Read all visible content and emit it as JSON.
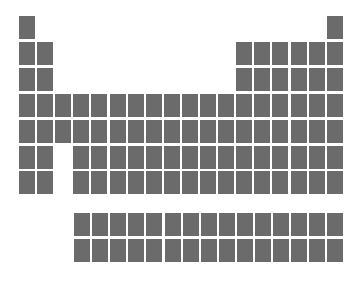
{
  "figure": {
    "name": "blank-periodic-table-grid",
    "width": 364,
    "height": 285,
    "background_color": "#ffffff",
    "cell_color": "#6b6b6b",
    "gap_color": "#ffffff"
  },
  "chart_data": {
    "type": "heatmap",
    "title": "",
    "subtitle": "",
    "xlabel": "",
    "ylabel": "",
    "grid": false,
    "legend": null,
    "annotations": [],
    "cell_value": null,
    "categories": [],
    "values": [],
    "geometry": {
      "main_origin_x": 19,
      "main_origin_y": 16,
      "f_origin_x": 74,
      "f_origin_y": 213,
      "cell_width": 16,
      "cell_height": 23,
      "pitch_x": 18.1,
      "pitch_y": 25.9
    },
    "main_block": {
      "columns": 18,
      "rows": 7,
      "occupancy": [
        [
          1,
          0,
          0,
          0,
          0,
          0,
          0,
          0,
          0,
          0,
          0,
          0,
          0,
          0,
          0,
          0,
          0,
          1
        ],
        [
          1,
          1,
          0,
          0,
          0,
          0,
          0,
          0,
          0,
          0,
          0,
          0,
          1,
          1,
          1,
          1,
          1,
          1
        ],
        [
          1,
          1,
          0,
          0,
          0,
          0,
          0,
          0,
          0,
          0,
          0,
          0,
          1,
          1,
          1,
          1,
          1,
          1
        ],
        [
          1,
          1,
          1,
          1,
          1,
          1,
          1,
          1,
          1,
          1,
          1,
          1,
          1,
          1,
          1,
          1,
          1,
          1
        ],
        [
          1,
          1,
          1,
          1,
          1,
          1,
          1,
          1,
          1,
          1,
          1,
          1,
          1,
          1,
          1,
          1,
          1,
          1
        ],
        [
          1,
          1,
          0,
          1,
          1,
          1,
          1,
          1,
          1,
          1,
          1,
          1,
          1,
          1,
          1,
          1,
          1,
          1
        ],
        [
          1,
          1,
          0,
          1,
          1,
          1,
          1,
          1,
          1,
          1,
          1,
          1,
          1,
          1,
          1,
          1,
          1,
          1
        ]
      ]
    },
    "f_block": {
      "columns": 15,
      "rows": 2,
      "occupancy": [
        [
          1,
          1,
          1,
          1,
          1,
          1,
          1,
          1,
          1,
          1,
          1,
          1,
          1,
          1,
          1
        ],
        [
          1,
          1,
          1,
          1,
          1,
          1,
          1,
          1,
          1,
          1,
          1,
          1,
          1,
          1,
          1
        ]
      ]
    }
  }
}
